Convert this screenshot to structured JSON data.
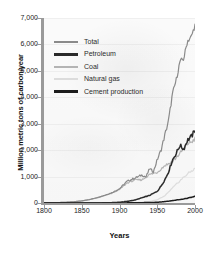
{
  "chart_data": {
    "type": "line",
    "title": "",
    "xlabel": "Years",
    "ylabel": "Million metric tons of carbon/year",
    "xlim": [
      1800,
      2000
    ],
    "ylim": [
      0,
      7000
    ],
    "grid": false,
    "legend_position": "upper-left",
    "xticks": [
      "1800",
      "1850",
      "1900",
      "1950",
      "2000"
    ],
    "yticks": [
      "0",
      "1,000",
      "2,000",
      "3,000",
      "4,000",
      "5,000",
      "6,000",
      "7,000"
    ],
    "series": [
      {
        "name": "Total",
        "color": "#8a8a8a",
        "x": [
          1800,
          1810,
          1820,
          1830,
          1840,
          1850,
          1860,
          1870,
          1880,
          1890,
          1900,
          1910,
          1920,
          1925,
          1930,
          1935,
          1940,
          1945,
          1950,
          1955,
          1960,
          1965,
          1970,
          1975,
          1980,
          1985,
          1990,
          1995,
          2000
        ],
        "values": [
          8,
          12,
          18,
          30,
          50,
          80,
          130,
          200,
          290,
          390,
          540,
          820,
          940,
          1000,
          1060,
          980,
          1300,
          1180,
          1640,
          2000,
          2560,
          3120,
          4100,
          4640,
          5340,
          5450,
          6130,
          6280,
          6730
        ]
      },
      {
        "name": "Petroleum",
        "color": "#2a2a2a",
        "x": [
          1800,
          1850,
          1870,
          1880,
          1890,
          1900,
          1910,
          1920,
          1930,
          1940,
          1950,
          1955,
          1960,
          1965,
          1970,
          1975,
          1980,
          1985,
          1990,
          1995,
          2000
        ],
        "values": [
          0,
          0,
          2,
          6,
          14,
          28,
          62,
          110,
          200,
          290,
          440,
          640,
          880,
          1180,
          1620,
          1870,
          2180,
          2030,
          2380,
          2500,
          2740
        ]
      },
      {
        "name": "Coal",
        "color": "#b4b4b4",
        "x": [
          1800,
          1810,
          1820,
          1830,
          1840,
          1850,
          1860,
          1870,
          1880,
          1890,
          1900,
          1910,
          1920,
          1930,
          1940,
          1950,
          1960,
          1970,
          1980,
          1990,
          1995,
          2000
        ],
        "values": [
          8,
          12,
          18,
          30,
          50,
          78,
          126,
          192,
          276,
          372,
          508,
          756,
          870,
          880,
          1080,
          1160,
          1420,
          1560,
          1870,
          2240,
          2310,
          2420
        ]
      },
      {
        "name": "Natural gas",
        "color": "#dcdcdc",
        "x": [
          1800,
          1880,
          1900,
          1920,
          1930,
          1940,
          1950,
          1960,
          1970,
          1980,
          1990,
          2000
        ],
        "values": [
          0,
          1,
          4,
          14,
          30,
          60,
          120,
          270,
          560,
          840,
          1100,
          1300
        ]
      },
      {
        "name": "Cement production",
        "color": "#1c1c1c",
        "x": [
          1800,
          1900,
          1920,
          1940,
          1950,
          1960,
          1970,
          1980,
          1990,
          2000
        ],
        "values": [
          0,
          2,
          8,
          18,
          28,
          52,
          90,
          130,
          180,
          250
        ]
      }
    ]
  },
  "legend": {
    "items": [
      {
        "label": "Total"
      },
      {
        "label": "Petroleum"
      },
      {
        "label": "Coal"
      },
      {
        "label": "Natural gas"
      },
      {
        "label": "Cement production"
      }
    ]
  }
}
